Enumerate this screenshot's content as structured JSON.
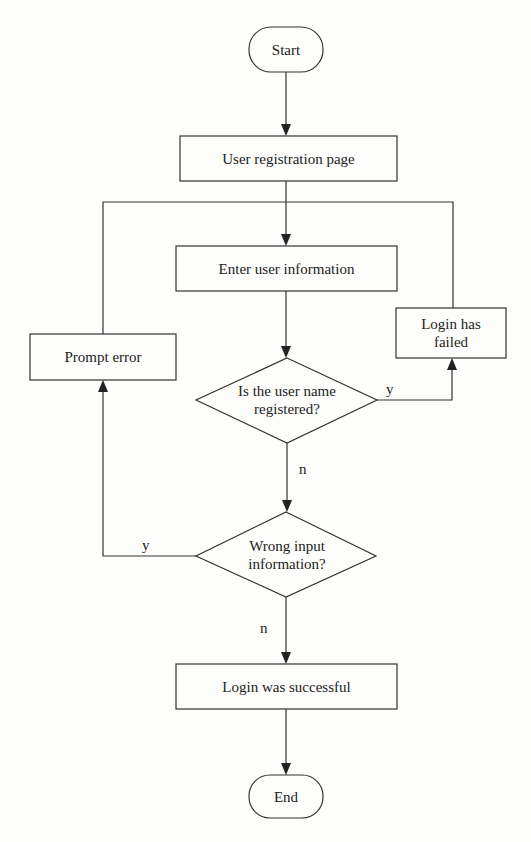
{
  "diagram": {
    "type": "flowchart",
    "nodes": {
      "start": "Start",
      "registration": "User registration page",
      "enter_info": "Enter user information",
      "prompt_error": "Prompt error",
      "login_failed_line1": "Login has",
      "login_failed_line2": "failed",
      "registered_q_line1": "Is the user name",
      "registered_q_line2": "registered?",
      "wrong_input_q_line1": "Wrong input",
      "wrong_input_q_line2": "information?",
      "success": "Login was successful",
      "end": "End"
    },
    "edge_labels": {
      "registered_yes": "y",
      "registered_no": "n",
      "wrong_yes": "y",
      "wrong_no": "n"
    },
    "colors": {
      "line": "#333333",
      "background": "#fdfdfb"
    }
  }
}
